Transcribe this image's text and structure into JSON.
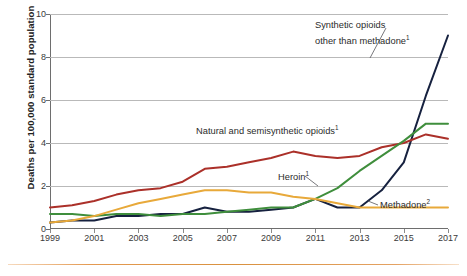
{
  "chart_data": {
    "type": "line",
    "title": "",
    "xlabel": "",
    "ylabel": "Deaths per 100,000 standard population",
    "x": [
      1999,
      2000,
      2001,
      2002,
      2003,
      2004,
      2005,
      2006,
      2007,
      2008,
      2009,
      2010,
      2011,
      2012,
      2013,
      2014,
      2015,
      2016,
      2017
    ],
    "xlim": [
      1999,
      2017
    ],
    "ylim": [
      0,
      10
    ],
    "yticks": [
      0,
      2,
      4,
      6,
      8,
      10
    ],
    "xticks": [
      1999,
      2001,
      2003,
      2005,
      2007,
      2009,
      2011,
      2013,
      2015,
      2017
    ],
    "grid": "horizontal",
    "legend": "annotations-inline",
    "series": [
      {
        "name": "Synthetic opioids other than methadone",
        "footnote": "1",
        "color": "#16213f",
        "values": [
          0.3,
          0.4,
          0.4,
          0.6,
          0.6,
          0.7,
          0.7,
          1.0,
          0.8,
          0.8,
          0.9,
          1.0,
          1.4,
          1.0,
          1.0,
          1.8,
          3.1,
          6.2,
          9.0
        ]
      },
      {
        "name": "Natural and semisynthetic opioids",
        "footnote": "1",
        "color": "#ab3029",
        "values": [
          1.0,
          1.1,
          1.3,
          1.6,
          1.8,
          1.9,
          2.2,
          2.8,
          2.9,
          3.1,
          3.3,
          3.6,
          3.4,
          3.3,
          3.4,
          3.8,
          4.0,
          4.4,
          4.2
        ]
      },
      {
        "name": "Heroin",
        "footnote": "1",
        "color": "#3f8e3c",
        "values": [
          0.7,
          0.7,
          0.6,
          0.7,
          0.7,
          0.6,
          0.7,
          0.7,
          0.8,
          0.9,
          1.0,
          1.0,
          1.4,
          1.9,
          2.7,
          3.4,
          4.1,
          4.9,
          4.9
        ]
      },
      {
        "name": "Methadone",
        "footnote": "2",
        "color": "#e8a93a",
        "values": [
          0.3,
          0.4,
          0.6,
          0.9,
          1.2,
          1.4,
          1.6,
          1.8,
          1.8,
          1.7,
          1.7,
          1.5,
          1.4,
          1.2,
          1.0,
          1.0,
          1.0,
          1.0,
          1.0
        ]
      }
    ]
  },
  "annotations": {
    "synthetic_line1": "Synthetic opioids",
    "synthetic_line2": "other than methadone",
    "synthetic_sup": "1",
    "natural": "Natural and semisynthetic opioids",
    "natural_sup": "1",
    "heroin": "Heroin",
    "heroin_sup": "1",
    "methadone": "Methadone",
    "methadone_sup": "2"
  },
  "style": {
    "accent_rule": "#d9913f",
    "grid_color": "#b9b9b9",
    "axis_color": "#6e6e6e"
  }
}
